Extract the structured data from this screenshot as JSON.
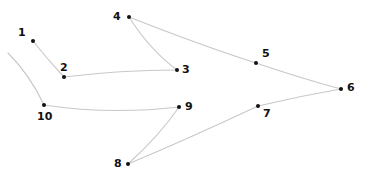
{
  "puzzle": {
    "type": "connect-the-dots",
    "line_color": "#c8c8c8",
    "dot_color": "#111111",
    "dots": [
      {
        "n": "1",
        "x": 33,
        "y": 41,
        "lx": 18,
        "ly": 27
      },
      {
        "n": "2",
        "x": 64,
        "y": 77,
        "lx": 60,
        "ly": 62
      },
      {
        "n": "3",
        "x": 177,
        "y": 70,
        "lx": 182,
        "ly": 64
      },
      {
        "n": "4",
        "x": 129,
        "y": 17,
        "lx": 113,
        "ly": 11
      },
      {
        "n": "5",
        "x": 256,
        "y": 63,
        "lx": 262,
        "ly": 48
      },
      {
        "n": "6",
        "x": 341,
        "y": 89,
        "lx": 347,
        "ly": 82
      },
      {
        "n": "7",
        "x": 258,
        "y": 106,
        "lx": 263,
        "ly": 108
      },
      {
        "n": "8",
        "x": 128,
        "y": 164,
        "lx": 114,
        "ly": 158
      },
      {
        "n": "9",
        "x": 179,
        "y": 107,
        "lx": 185,
        "ly": 101
      },
      {
        "n": "10",
        "x": 44,
        "y": 105,
        "lx": 37,
        "ly": 111
      }
    ],
    "lines": [
      "M33,41 Q48,60 64,77",
      "M64,77 Q120,70 177,70",
      "M177,70 Q150,50 129,17",
      "M129,17 Q200,45 256,63 Q300,78 341,89",
      "M341,89 Q300,96 258,106 Q190,138 128,164",
      "M128,164 Q160,135 179,107",
      "M179,107 Q110,115 44,105",
      "M44,105 Q30,75 8,53"
    ]
  }
}
